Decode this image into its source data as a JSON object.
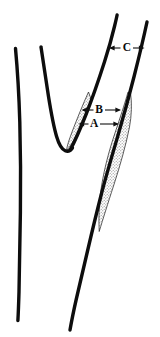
{
  "figure": {
    "background_color": "#ffffff",
    "ink_color": "#0d0d0d",
    "plaque_fill_color": "#b3b3b3",
    "plaque_pattern": "stipple-dots",
    "width": 160,
    "height": 337
  },
  "labels": [
    {
      "id": "label-c",
      "text": "C",
      "x": 127,
      "y": 48,
      "description": "lumen diameter of distal internal carotid artery",
      "leader_left_x": 110,
      "leader_right_x": 146,
      "arrows": "double"
    },
    {
      "id": "label-b",
      "text": "B",
      "x": 99,
      "y": 110,
      "description": "outer vessel diameter at stenosis",
      "leader_left_x": 82,
      "leader_right_x": 121,
      "arrows": "double"
    },
    {
      "id": "label-a",
      "text": "A",
      "x": 94,
      "y": 124,
      "description": "residual lumen diameter at stenosis",
      "leader_left_x": 79,
      "leader_right_x": 119,
      "arrows": "double"
    }
  ],
  "structures": [
    {
      "id": "external-carotid-outer-wall",
      "label": "external carotid outer wall"
    },
    {
      "id": "external-carotid-inner-wall",
      "label": "external carotid inner wall"
    },
    {
      "id": "internal-carotid-inner-wall",
      "label": "internal carotid inner wall"
    },
    {
      "id": "internal-carotid-outer-wall",
      "label": "internal carotid outer wall"
    },
    {
      "id": "plaque-medial-sliver",
      "label": "medial plaque sliver"
    },
    {
      "id": "plaque-lateral-wedge",
      "label": "lateral plaque wedge"
    }
  ]
}
